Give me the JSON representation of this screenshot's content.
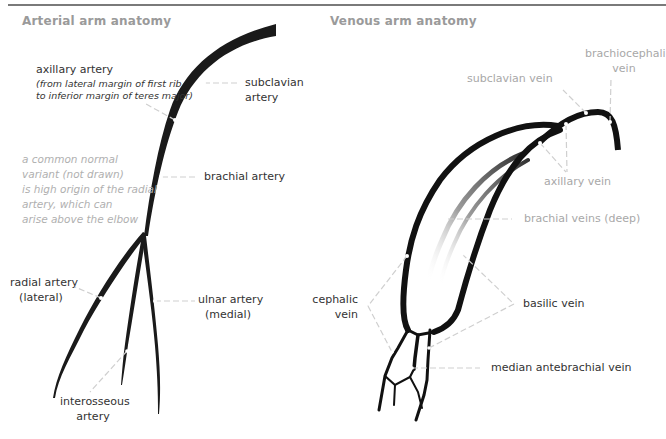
{
  "arterial": {
    "title": "Arterial arm anatomy",
    "labels": {
      "axillary_title": "axillary artery",
      "axillary_note_1": "(from lateral margin of first rib",
      "axillary_note_2": "to inferior margin of teres major)",
      "subclavian_1": "subclavian",
      "subclavian_2": "artery",
      "brachial": "brachial artery",
      "variant_1": "a common normal",
      "variant_2": "variant (not drawn)",
      "variant_3": "is high origin of the radial",
      "variant_4": "artery, which can",
      "variant_5": "arise above the elbow",
      "radial_1": "radial artery",
      "radial_2": "(lateral)",
      "ulnar_1": "ulnar artery",
      "ulnar_2": "(medial)",
      "interosseous_1": "interosseous",
      "interosseous_2": "artery"
    }
  },
  "venous": {
    "title": "Venous arm anatomy",
    "labels": {
      "brachiocephalic_1": "brachiocephalic",
      "brachiocephalic_2": "vein",
      "subclavian": "subclavian vein",
      "axillary": "axillary vein",
      "brachial_deep": "brachial veins (deep)",
      "cephalic_1": "cephalic",
      "cephalic_2": "vein",
      "basilic": "basilic vein",
      "median_antebrachial": "median antebrachial vein"
    }
  },
  "colors": {
    "vessel": "#1a1a1a",
    "leader": "#cfcfcf",
    "title": "#9a9a9a",
    "label_dark": "#333333",
    "label_light": "#a8a8a8",
    "rule": "#7a7a7a"
  }
}
